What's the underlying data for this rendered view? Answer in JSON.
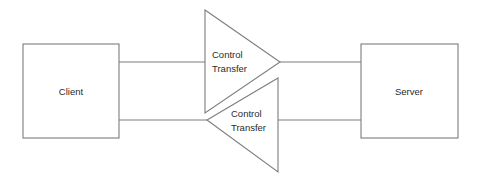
{
  "diagram": {
    "title": "Control Transfer",
    "canvas": {
      "width": 483,
      "height": 185,
      "background": "#ffffff"
    },
    "stroke_color": "#7d7d7d",
    "text_color": "#2b2b2b",
    "nodes": [
      {
        "id": "client",
        "label": "Client",
        "shape": "rectangle",
        "x": 23,
        "y": 44,
        "width": 96,
        "height": 94,
        "label_x": 71,
        "label_y": 92
      },
      {
        "id": "server",
        "label": "Server",
        "shape": "rectangle",
        "x": 361,
        "y": 44,
        "width": 97,
        "height": 94,
        "label_x": 409,
        "label_y": 92
      }
    ],
    "processes": [
      {
        "id": "control-transfer-request",
        "shape": "triangle",
        "direction": "right",
        "points": "205,10 280,62 205,113",
        "label_line1": "Control",
        "label_line2": "Transfer",
        "label_x": 212,
        "label_y1": 58,
        "label_y2": 72
      },
      {
        "id": "control-transfer-response",
        "shape": "triangle",
        "direction": "left",
        "points": "207,120 278,78 278,172",
        "label_line1": "Control",
        "label_line2": "Transfer",
        "label_x": 231,
        "label_y1": 117,
        "label_y2": 131
      }
    ],
    "connectors": [
      {
        "id": "client-to-upper-triangle",
        "x1": 119,
        "y1": 62,
        "x2": 205,
        "y2": 62
      },
      {
        "id": "upper-triangle-to-server",
        "x1": 280,
        "y1": 62,
        "x2": 361,
        "y2": 62
      },
      {
        "id": "client-to-lower-triangle",
        "x1": 119,
        "y1": 120,
        "x2": 207,
        "y2": 120
      },
      {
        "id": "lower-triangle-to-server",
        "x1": 278,
        "y1": 120,
        "x2": 361,
        "y2": 120
      }
    ]
  }
}
